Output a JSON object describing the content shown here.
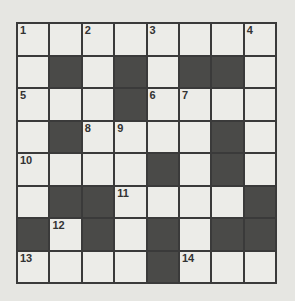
{
  "puzzle": {
    "type": "crossword",
    "rows": 8,
    "cols": 8,
    "grid": [
      [
        "1",
        "",
        "2",
        "",
        "3",
        "",
        "",
        "4"
      ],
      [
        "",
        "#",
        "",
        "#",
        "",
        "#",
        "#",
        ""
      ],
      [
        "5",
        "",
        "",
        "#",
        "6",
        "7",
        "",
        ""
      ],
      [
        "",
        "#",
        "8",
        "9",
        "",
        "",
        "#",
        ""
      ],
      [
        "10",
        "",
        "",
        "",
        "#",
        "",
        "#",
        ""
      ],
      [
        "",
        "#",
        "#",
        "11",
        "",
        "",
        "",
        "#"
      ],
      [
        "#",
        "12",
        "#",
        "",
        "#",
        "",
        "#",
        "#"
      ],
      [
        "13",
        "",
        "",
        "",
        "#",
        "14",
        "",
        ""
      ]
    ],
    "colors": {
      "black": "#4a4a48",
      "white": "#ecece8",
      "line": "#3a3a3a",
      "background": "#e6e6e2"
    }
  }
}
